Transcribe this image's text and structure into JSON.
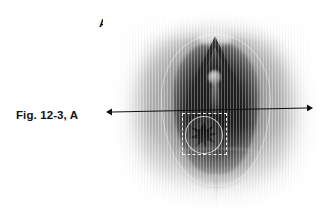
{
  "figure": {
    "caption": "Fig. 12-3, A",
    "panel_letter": "A",
    "image_type": "clinical photograph",
    "background_color": "#ffffff"
  },
  "annotations": {
    "measurement_arrow": {
      "name": "double-headed-width-arrow",
      "color": "#101010",
      "left_tip_x": 106,
      "left_tip_y": 112,
      "right_tip_x": 313,
      "right_tip_y": 108
    },
    "roi_box": {
      "name": "dashed-region-of-interest-box",
      "style": "dashed",
      "color": "#f2f2f2",
      "x": 182,
      "y": 113,
      "width": 45,
      "height": 42
    },
    "roi_circle": {
      "name": "circled-feature-outline",
      "color": "#eeeeee"
    },
    "roi_star": {
      "name": "dark-stellate-feature",
      "color": "#0d0d0d"
    }
  },
  "photo": {
    "name": "clinical-photograph",
    "x": 103,
    "y": 8,
    "width": 224,
    "height": 212,
    "tone_range": [
      "#0d0d0d",
      "#ffffff"
    ]
  }
}
